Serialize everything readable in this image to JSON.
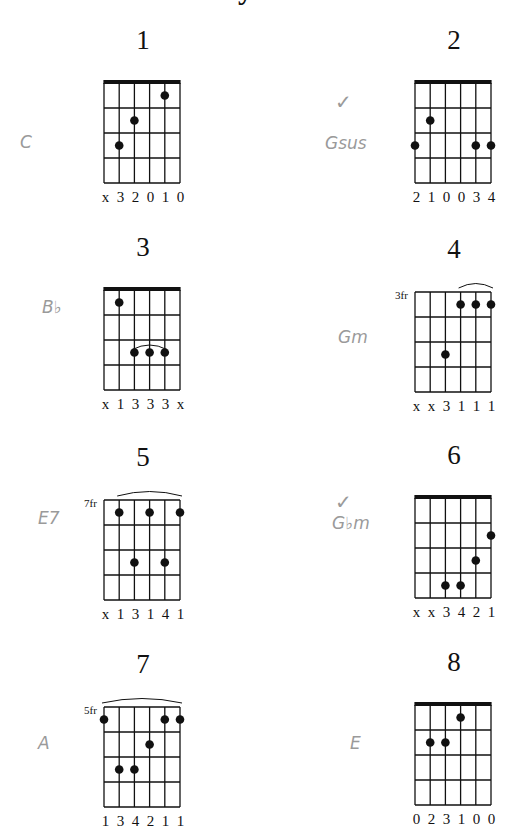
{
  "title_fragment": "y",
  "charts": [
    {
      "number": "1",
      "position": "",
      "nut": true,
      "barre": null,
      "dots": [
        [
          1,
          3
        ],
        [
          2,
          2
        ],
        [
          4,
          1
        ]
      ],
      "fingers": [
        "x",
        "3",
        "2",
        "0",
        "1",
        "0"
      ],
      "note": "C"
    },
    {
      "number": "2",
      "position": "",
      "nut": true,
      "barre": null,
      "dots": [
        [
          0,
          3
        ],
        [
          1,
          2
        ],
        [
          4,
          3
        ],
        [
          5,
          3
        ]
      ],
      "fingers": [
        "2",
        "1",
        "0",
        "0",
        "3",
        "4"
      ],
      "note": "Gsus",
      "check": "✓"
    },
    {
      "number": "3",
      "position": "",
      "nut": true,
      "barre": [
        2,
        4,
        3
      ],
      "dots": [
        [
          1,
          1
        ],
        [
          2,
          3
        ],
        [
          3,
          3
        ],
        [
          4,
          3
        ]
      ],
      "fingers": [
        "x",
        "1",
        "3",
        "3",
        "3",
        "x"
      ],
      "note": "B♭"
    },
    {
      "number": "4",
      "position": "3fr",
      "nut": false,
      "barre": [
        3,
        5,
        0
      ],
      "dots": [
        [
          3,
          1
        ],
        [
          4,
          1
        ],
        [
          5,
          1
        ],
        [
          2,
          3
        ]
      ],
      "fingers": [
        "x",
        "x",
        "3",
        "1",
        "1",
        "1"
      ],
      "note": "Gm"
    },
    {
      "number": "5",
      "position": "7fr",
      "nut": false,
      "barre": [
        1,
        5,
        0
      ],
      "dots": [
        [
          1,
          1
        ],
        [
          3,
          1
        ],
        [
          5,
          1
        ],
        [
          2,
          3
        ],
        [
          4,
          3
        ]
      ],
      "fingers": [
        "x",
        "1",
        "3",
        "1",
        "4",
        "1"
      ],
      "note": "E7"
    },
    {
      "number": "6",
      "position": "",
      "nut": true,
      "barre": null,
      "dots": [
        [
          5,
          2
        ],
        [
          4,
          3
        ],
        [
          2,
          4
        ],
        [
          3,
          4
        ]
      ],
      "fingers": [
        "x",
        "x",
        "3",
        "4",
        "2",
        "1"
      ],
      "note": "G♭m",
      "check": "✓"
    },
    {
      "number": "7",
      "position": "5fr",
      "nut": false,
      "barre": [
        0,
        5,
        0
      ],
      "dots": [
        [
          0,
          1
        ],
        [
          4,
          1
        ],
        [
          5,
          1
        ],
        [
          3,
          2
        ],
        [
          1,
          3
        ],
        [
          2,
          3
        ]
      ],
      "fingers": [
        "1",
        "3",
        "4",
        "2",
        "1",
        "1"
      ],
      "note": "A"
    },
    {
      "number": "8",
      "position": "",
      "nut": true,
      "barre": null,
      "dots": [
        [
          3,
          1
        ],
        [
          1,
          2
        ],
        [
          2,
          2
        ]
      ],
      "fingers": [
        "0",
        "2",
        "3",
        "1",
        "0",
        "0"
      ],
      "note": "E"
    }
  ],
  "colors": {
    "ink": "#111111",
    "pencil": "#9a9a9a",
    "background": "#ffffff"
  }
}
